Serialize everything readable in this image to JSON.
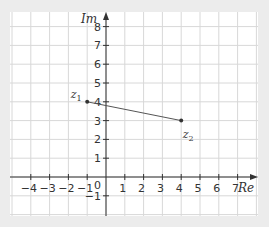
{
  "chart_data": {
    "type": "scatter",
    "title": "",
    "xlabel": "Re",
    "ylabel": "Im",
    "xlim": [
      -5,
      7.5
    ],
    "ylim": [
      -2,
      9
    ],
    "x_ticks": [
      -4,
      -3,
      -2,
      -1,
      1,
      2,
      3,
      4,
      5,
      6,
      7
    ],
    "y_ticks": [
      -1,
      1,
      2,
      3,
      4,
      5,
      6,
      7,
      8
    ],
    "origin_label": "0",
    "grid": true,
    "points": [
      {
        "name": "z1",
        "label_main": "z",
        "label_sub": "1",
        "x": -1,
        "y": 4
      },
      {
        "name": "z2",
        "label_main": "z",
        "label_sub": "2",
        "x": 4,
        "y": 3
      }
    ],
    "segments": [
      {
        "from": "z1",
        "to": "z2"
      }
    ]
  },
  "colors": {
    "background": "#ececec",
    "grid_bg": "#ffffff",
    "grid_line": "#d8d8d8",
    "axis": "#333333",
    "segment": "#555555",
    "text": "#333333"
  }
}
